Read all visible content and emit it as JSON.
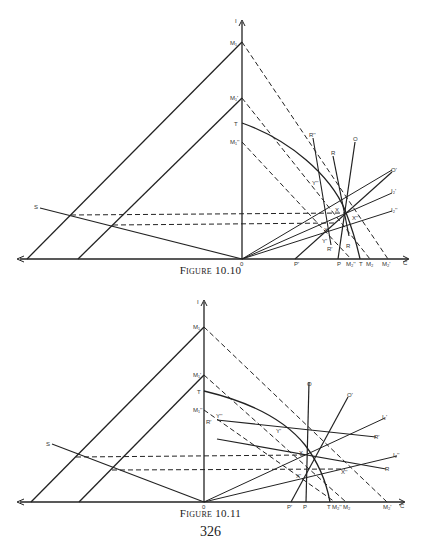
{
  "page": {
    "page_number": "326"
  },
  "figures": [
    {
      "caption": "Figure 10.10",
      "axes": {
        "vertical_label": "I",
        "horizontal_label": "C",
        "origin_label": "0"
      },
      "point_labels": {
        "vertical_axis": [
          "M1",
          "M1'",
          "T",
          "M1''"
        ],
        "horizontal_axis": [
          "P'",
          "P",
          "M2''",
          "T",
          "M2",
          "M2'"
        ],
        "curves": [
          "S",
          "R''",
          "R",
          "O",
          "O'",
          "I2'",
          "I2''"
        ],
        "intersections": [
          "Y''",
          "X",
          "X''",
          "X'",
          "Y'",
          "R'",
          "R"
        ]
      }
    },
    {
      "caption": "Figure 10.11",
      "axes": {
        "vertical_label": "I",
        "horizontal_label": "C",
        "origin_label": "0"
      },
      "point_labels": {
        "vertical_axis": [
          "M1",
          "M1'",
          "T",
          "M1''"
        ],
        "horizontal_axis": [
          "P'",
          "P",
          "T",
          "M2''",
          "M2",
          "M2'"
        ],
        "curves": [
          "S",
          "O",
          "O'",
          "I2'",
          "I2''",
          "R'",
          "R"
        ],
        "intersections": [
          "Y''",
          "R'",
          "Y'",
          "X",
          "X'",
          "X''"
        ]
      }
    }
  ],
  "labels": {
    "f1": {
      "I": "I",
      "M1": "M₁",
      "M1p": "M₁'",
      "T": "T",
      "M1pp": "M₁''",
      "S": "S",
      "O0": "0",
      "C": "C",
      "Rpp": "R''",
      "R": "R",
      "O": "O",
      "Op": "O'",
      "I2p": "I₂'",
      "I2pp": "I₂''",
      "Ypp": "Y''",
      "X": "X",
      "Xpp": "X''",
      "Xp": "X'",
      "Yp": "Y'",
      "Rp_low": "R'",
      "R_low": "R",
      "Pp": "P'",
      "P": "P",
      "M2pp": "M₂''",
      "T_ax": "T",
      "M2": "M₂",
      "M2p": "M₂'"
    },
    "f2": {
      "I": "I",
      "M1": "M₁",
      "M1p": "M₁'",
      "T": "T",
      "M1pp": "M₁''",
      "S": "S",
      "O0": "0",
      "C": "C",
      "O": "O",
      "Op": "O'",
      "I2p": "I₂'",
      "I2pp": "I₂''",
      "Ypp": "Y''",
      "Rp_left": "R'",
      "Yp": "Y'",
      "Rp_right": "R'",
      "R": "R",
      "X": "X",
      "Xp": "X'",
      "Xpp": "X''",
      "Pp": "P'",
      "P": "P",
      "T_ax": "T",
      "M2pp": "M₂''",
      "M2": "M₂",
      "M2p": "M₂'"
    }
  }
}
